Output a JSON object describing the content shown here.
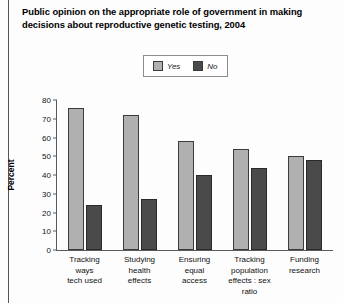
{
  "title": "Public opinion on the appropriate role of government in making decisions about reproductive genetic testing, 2004",
  "legend": {
    "entries": [
      {
        "label": "Yes",
        "color": "#b0b0b0",
        "icon": "legend-swatch-yes"
      },
      {
        "label": "No",
        "color": "#4a4a4a",
        "icon": "legend-swatch-no"
      }
    ]
  },
  "chart_data": {
    "type": "bar",
    "title": "Public opinion on the appropriate role of government in making decisions about reproductive genetic testing, 2004",
    "xlabel": "",
    "ylabel": "Percent",
    "ylim": [
      0,
      80
    ],
    "yticks": [
      0,
      10,
      20,
      30,
      40,
      50,
      60,
      70,
      80
    ],
    "grid": false,
    "legend_position": "top-center",
    "categories": [
      "Tracking ways tech used",
      "Studying health effects",
      "Ensuring equal access",
      "Tracking population effects : sex ratio",
      "Funding research"
    ],
    "category_lines": [
      [
        "Tracking",
        "ways",
        "tech used"
      ],
      [
        "Studying",
        "health",
        "effects"
      ],
      [
        "Ensuring",
        "equal",
        "access"
      ],
      [
        "Tracking",
        "population",
        "effects : sex ratio"
      ],
      [
        "Funding",
        "research"
      ]
    ],
    "series": [
      {
        "name": "Yes",
        "color": "#b0b0b0",
        "values": [
          76,
          72,
          58,
          54,
          50
        ]
      },
      {
        "name": "No",
        "color": "#4a4a4a",
        "values": [
          24,
          27,
          40,
          44,
          48
        ]
      }
    ]
  }
}
